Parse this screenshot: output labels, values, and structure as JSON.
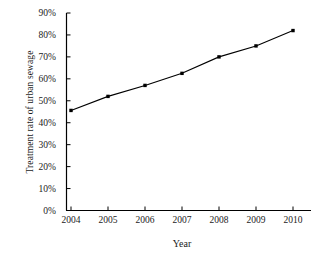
{
  "chart_data": {
    "type": "line",
    "title": "",
    "xlabel": "Year",
    "ylabel": "Treatment rate of urban sewage",
    "categories": [
      "2004",
      "2005",
      "2006",
      "2007",
      "2008",
      "2009",
      "2010"
    ],
    "x": [
      2004,
      2005,
      2006,
      2007,
      2008,
      2009,
      2010
    ],
    "values": [
      45.6,
      52.0,
      57.0,
      62.5,
      70.0,
      75.0,
      82.0
    ],
    "series": [
      {
        "name": "Treatment rate of urban sewage",
        "values": [
          45.6,
          52.0,
          57.0,
          62.5,
          70.0,
          75.0,
          82.0
        ]
      }
    ],
    "y_tick_labels": [
      "90%",
      "80%",
      "70%",
      "60%",
      "50%",
      "40%",
      "30%",
      "20%",
      "10%",
      "0%"
    ],
    "y_tick_values": [
      90,
      80,
      70,
      60,
      50,
      40,
      30,
      20,
      10,
      0
    ],
    "ylim": [
      0,
      90
    ],
    "xlim": [
      2003.6,
      2010.5
    ],
    "grid": false,
    "legend": "none",
    "line_color": "#000000",
    "marker_color": "#000000",
    "marker_shape": "square",
    "background_color": "#ffffff",
    "axis_color": "#000000"
  },
  "axis": {
    "y_title": "Treatment rate of urban sewage",
    "x_title": "Year"
  }
}
